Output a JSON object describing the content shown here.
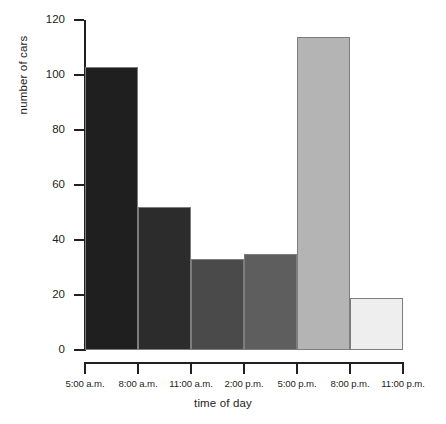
{
  "chart_data": {
    "type": "bar",
    "title": "",
    "xlabel": "time of day",
    "ylabel": "number of cars",
    "ylim": [
      0,
      120
    ],
    "yticks": [
      0,
      20,
      40,
      60,
      80,
      100,
      120
    ],
    "ytick_labels": [
      "0",
      "20",
      "40",
      "60",
      "80",
      "100",
      "120"
    ],
    "grid": false,
    "legend": null,
    "bin_edges": [
      "5:00 a.m.",
      "8:00 a.m.",
      "11:00 a.m.",
      "2:00 p.m.",
      "5:00 p.m.",
      "8:00 p.m.",
      "11:00 p.m."
    ],
    "categories": [
      "5:00 a.m. - 8:00 a.m.",
      "8:00 a.m. - 11:00 a.m.",
      "11:00 a.m. - 2:00 p.m.",
      "2:00 p.m. - 5:00 p.m.",
      "5:00 p.m. - 8:00 p.m.",
      "8:00 p.m. - 11:00 p.m."
    ],
    "values": [
      103,
      52,
      33,
      35,
      114,
      19
    ],
    "bar_colors": [
      "#1f1f1f",
      "#2c2c2c",
      "#4a4a4a",
      "#5e5e5e",
      "#b4b4b4",
      "#eeeeee"
    ],
    "bar_edge_color": "#7d7d7d",
    "axis_color": "#231f20"
  }
}
